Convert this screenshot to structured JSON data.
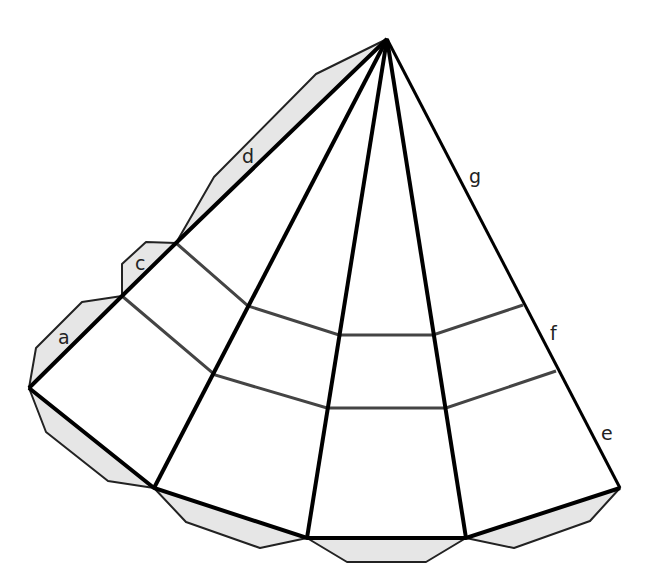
{
  "diagram": {
    "apex": [
      387,
      39
    ],
    "base_points": [
      [
        29,
        388
      ],
      [
        154,
        488
      ],
      [
        307,
        538
      ],
      [
        466,
        538
      ],
      [
        620,
        488
      ]
    ],
    "left_edge_points": [
      [
        29,
        388
      ],
      [
        122,
        296
      ],
      [
        176,
        243
      ]
    ],
    "upper_row": [
      [
        176,
        243
      ],
      [
        248,
        306
      ],
      [
        339,
        335
      ],
      [
        433,
        335
      ],
      [
        523,
        305
      ]
    ],
    "lower_row": [
      [
        122,
        296
      ],
      [
        215,
        375
      ],
      [
        327,
        408
      ],
      [
        446,
        408
      ],
      [
        556,
        371
      ]
    ],
    "tabs": [
      {
        "name": "tab-d",
        "points": [
          [
            387,
            39
          ],
          [
            316,
            74
          ],
          [
            214,
            177
          ],
          [
            176,
            243
          ]
        ]
      },
      {
        "name": "tab-c",
        "points": [
          [
            176,
            243
          ],
          [
            146,
            242
          ],
          [
            122,
            264
          ],
          [
            122,
            296
          ]
        ]
      },
      {
        "name": "tab-a",
        "points": [
          [
            122,
            296
          ],
          [
            82,
            302
          ],
          [
            36,
            348
          ],
          [
            29,
            388
          ]
        ]
      },
      {
        "name": "tab-bottom-1",
        "points": [
          [
            29,
            388
          ],
          [
            46,
            432
          ],
          [
            108,
            481
          ],
          [
            154,
            488
          ]
        ]
      },
      {
        "name": "tab-bottom-2",
        "points": [
          [
            154,
            488
          ],
          [
            186,
            522
          ],
          [
            260,
            548
          ],
          [
            307,
            538
          ]
        ]
      },
      {
        "name": "tab-bottom-3",
        "points": [
          [
            307,
            538
          ],
          [
            347,
            562
          ],
          [
            426,
            562
          ],
          [
            466,
            538
          ]
        ]
      },
      {
        "name": "tab-bottom-4",
        "points": [
          [
            466,
            538
          ],
          [
            514,
            548
          ],
          [
            590,
            521
          ],
          [
            620,
            488
          ]
        ]
      }
    ],
    "labels": [
      {
        "text": "a",
        "x": 58,
        "y": 344
      },
      {
        "text": "c",
        "x": 135,
        "y": 270
      },
      {
        "text": "d",
        "x": 242,
        "y": 163
      },
      {
        "text": "g",
        "x": 469,
        "y": 183
      },
      {
        "text": "f",
        "x": 550,
        "y": 340
      },
      {
        "text": "e",
        "x": 601,
        "y": 440
      }
    ],
    "colors": {
      "edge": "#000000",
      "fold": "#444444",
      "tab_fill": "#e6e6e6"
    }
  }
}
